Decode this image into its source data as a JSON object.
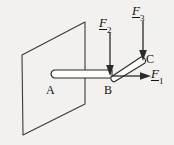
{
  "figure": {
    "type": "physics-free-body-diagram",
    "background_color": "#f2f1ef",
    "stroke_color": "#2a2a2a",
    "fill_color": "#fbfbfa",
    "text_color": "#131313",
    "points": [
      {
        "id": "A",
        "label": "A",
        "x": 50,
        "y": 86,
        "description": "free end of horizontal rod"
      },
      {
        "id": "B",
        "label": "B",
        "x": 106,
        "y": 86,
        "description": "junction at wall where rods meet"
      },
      {
        "id": "C",
        "label": "C",
        "x": 146,
        "y": 56,
        "description": "upper end of inclined rod"
      }
    ],
    "forces": [
      {
        "id": "F1",
        "base": "F",
        "subscript": "1",
        "underlined": true,
        "direction": "right",
        "applied_at": "B",
        "label_x": 152,
        "label_y": 68
      },
      {
        "id": "F2",
        "base": "F",
        "subscript": "2",
        "underlined": true,
        "direction": "down",
        "applied_at": "B",
        "label_x": 98,
        "label_y": 16
      },
      {
        "id": "F3",
        "base": "F",
        "subscript": "3",
        "underlined": true,
        "direction": "down",
        "applied_at": "C",
        "label_x": 131,
        "label_y": 4
      }
    ],
    "wall": {
      "name": "wall-plane",
      "shape": "parallelogram",
      "corners": [
        [
          22,
          55
        ],
        [
          85,
          22
        ],
        [
          85,
          104
        ],
        [
          23,
          135
        ]
      ]
    },
    "rods": [
      {
        "id": "AB",
        "from": "A",
        "to": "B",
        "orientation": "horizontal"
      },
      {
        "id": "BC",
        "from": "B",
        "to": "C",
        "orientation": "inclined"
      }
    ]
  }
}
